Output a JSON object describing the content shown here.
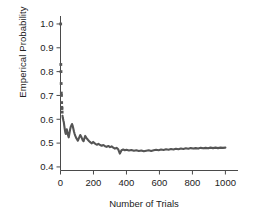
{
  "chart_data": {
    "type": "scatter",
    "title": "",
    "xlabel": "Number of Trials",
    "ylabel": "Emperical Probability",
    "xlim": [
      0,
      1040
    ],
    "ylim": [
      0.385,
      1.025
    ],
    "xticks": [
      0,
      200,
      400,
      600,
      800,
      1000
    ],
    "xtick_labels": [
      "0",
      "200",
      "400",
      "600",
      "800",
      "1000"
    ],
    "yticks": [
      0.4,
      0.5,
      0.6,
      0.7,
      0.8,
      0.9,
      1.0
    ],
    "ytick_labels": [
      "0.4",
      "0.5",
      "0.6",
      "0.7",
      "0.8",
      "0.9",
      "1.0"
    ],
    "grid": false,
    "legend": null,
    "marker_color": "#555555",
    "axis_color": "#4a4a4a",
    "background": "#ffffff",
    "x": [
      1,
      2,
      3,
      4,
      5,
      6,
      7,
      8,
      9,
      10,
      12,
      14,
      16,
      18,
      20,
      23,
      26,
      29,
      32,
      35,
      38,
      42,
      46,
      50,
      54,
      58,
      62,
      66,
      70,
      74,
      78,
      82,
      86,
      90,
      95,
      100,
      105,
      110,
      115,
      120,
      125,
      130,
      135,
      140,
      145,
      150,
      158,
      166,
      174,
      182,
      190,
      198,
      206,
      214,
      222,
      230,
      240,
      250,
      260,
      270,
      280,
      290,
      300,
      310,
      320,
      330,
      340,
      350,
      360,
      370,
      380,
      390,
      400,
      415,
      430,
      445,
      460,
      475,
      490,
      505,
      520,
      535,
      550,
      565,
      580,
      595,
      610,
      625,
      640,
      655,
      670,
      685,
      700,
      715,
      730,
      745,
      760,
      775,
      790,
      805,
      820,
      835,
      850,
      865,
      880,
      895,
      910,
      925,
      940,
      955,
      970,
      985,
      1000
    ],
    "y": [
      1.0,
      0.83,
      0.8,
      0.75,
      0.71,
      0.7,
      0.67,
      0.65,
      0.645,
      0.63,
      0.615,
      0.605,
      0.6,
      0.593,
      0.588,
      0.572,
      0.558,
      0.546,
      0.538,
      0.548,
      0.558,
      0.545,
      0.532,
      0.524,
      0.54,
      0.556,
      0.568,
      0.574,
      0.58,
      0.572,
      0.56,
      0.548,
      0.538,
      0.53,
      0.522,
      0.516,
      0.51,
      0.518,
      0.526,
      0.534,
      0.528,
      0.52,
      0.512,
      0.508,
      0.52,
      0.53,
      0.521,
      0.514,
      0.508,
      0.503,
      0.499,
      0.505,
      0.5,
      0.496,
      0.493,
      0.497,
      0.492,
      0.489,
      0.492,
      0.487,
      0.484,
      0.488,
      0.483,
      0.486,
      0.481,
      0.477,
      0.48,
      0.474,
      0.456,
      0.47,
      0.473,
      0.47,
      0.472,
      0.469,
      0.471,
      0.468,
      0.47,
      0.467,
      0.469,
      0.466,
      0.468,
      0.47,
      0.467,
      0.47,
      0.472,
      0.47,
      0.473,
      0.471,
      0.474,
      0.472,
      0.475,
      0.473,
      0.476,
      0.474,
      0.477,
      0.475,
      0.478,
      0.476,
      0.479,
      0.477,
      0.479,
      0.477,
      0.48,
      0.478,
      0.48,
      0.478,
      0.481,
      0.479,
      0.481,
      0.479,
      0.481,
      0.48,
      0.481
    ],
    "scatter_head_count": 10
  }
}
